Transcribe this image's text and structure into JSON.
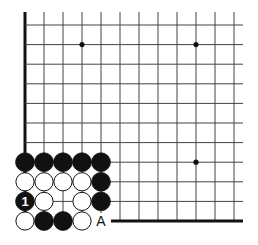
{
  "diagram": {
    "type": "go-board-corner",
    "grid": {
      "cols": 12,
      "rows": 11,
      "x0": 25,
      "dx": 19,
      "y0": 25,
      "dy": 19.6,
      "line_right_x": 243,
      "line_color": "#444444",
      "edge_color": "#111111"
    },
    "edges": [
      "left",
      "bottom"
    ],
    "star_points": [
      [
        3,
        1
      ],
      [
        9,
        1
      ],
      [
        9,
        7
      ]
    ],
    "stones": [
      {
        "col": 0,
        "row": 7,
        "color": "black"
      },
      {
        "col": 1,
        "row": 7,
        "color": "black"
      },
      {
        "col": 2,
        "row": 7,
        "color": "black"
      },
      {
        "col": 3,
        "row": 7,
        "color": "black"
      },
      {
        "col": 4,
        "row": 7,
        "color": "black"
      },
      {
        "col": 0,
        "row": 8,
        "color": "white"
      },
      {
        "col": 1,
        "row": 8,
        "color": "white"
      },
      {
        "col": 2,
        "row": 8,
        "color": "white"
      },
      {
        "col": 3,
        "row": 8,
        "color": "white"
      },
      {
        "col": 4,
        "row": 8,
        "color": "black"
      },
      {
        "col": 0,
        "row": 9,
        "color": "black",
        "label": "1"
      },
      {
        "col": 1,
        "row": 9,
        "color": "white"
      },
      {
        "col": 3,
        "row": 9,
        "color": "white"
      },
      {
        "col": 4,
        "row": 9,
        "color": "black"
      },
      {
        "col": 0,
        "row": 10,
        "color": "white"
      },
      {
        "col": 1,
        "row": 10,
        "color": "black"
      },
      {
        "col": 2,
        "row": 10,
        "color": "black"
      },
      {
        "col": 3,
        "row": 10,
        "color": "white"
      }
    ],
    "labels": [
      {
        "col": 4,
        "row": 10,
        "text": "A"
      }
    ],
    "move_label": "1",
    "point_label": "A"
  }
}
